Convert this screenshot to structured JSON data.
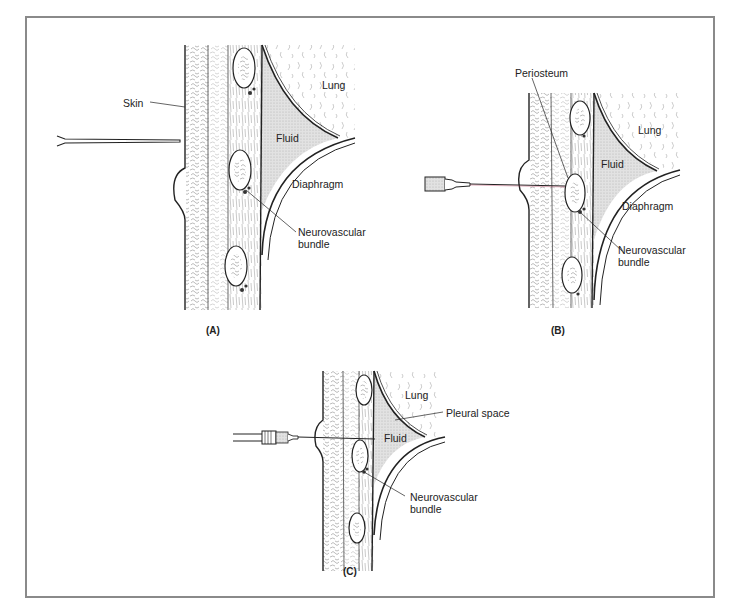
{
  "figure": {
    "panels": [
      {
        "id": "A",
        "caption": "(A)",
        "labels": {
          "skin": "Skin",
          "lung": "Lung",
          "fluid": "Fluid",
          "diaphragm": "Diaphragm",
          "neurovascular": "Neurovascular",
          "bundle": "bundle"
        }
      },
      {
        "id": "B",
        "caption": "(B)",
        "labels": {
          "periosteum": "Periosteum",
          "lung": "Lung",
          "fluid": "Fluid",
          "diaphragm": "Diaphragm",
          "neurovascular": "Neurovascular",
          "bundle": "bundle"
        }
      },
      {
        "id": "C",
        "caption": "(C)",
        "labels": {
          "lung": "Lung",
          "pleural_space": "Pleural space",
          "fluid": "Fluid",
          "neurovascular": "Neurovascular",
          "bundle": "bundle"
        }
      }
    ]
  },
  "colors": {
    "frame": "#8a8a8a",
    "ink": "#222222",
    "fluid": "#d9d9d9"
  }
}
